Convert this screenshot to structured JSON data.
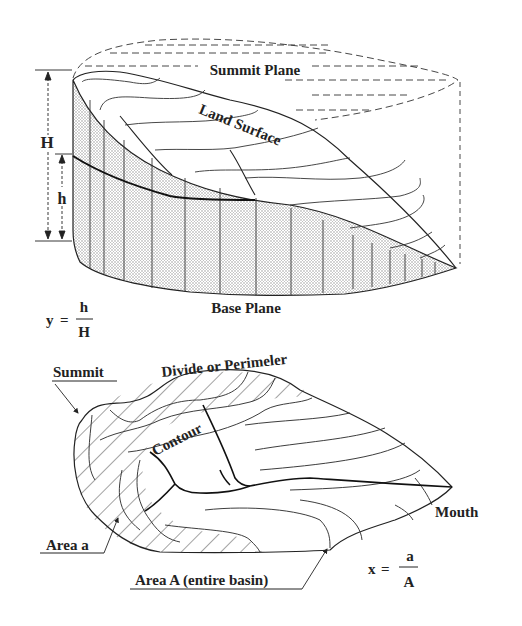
{
  "figure": {
    "top_panel": {
      "summit_plane_label": "Summit Plane",
      "land_surface_label": "Land Surface",
      "base_plane_label": "Base Plane",
      "total_height_label": "H",
      "partial_height_label": "h",
      "ratio_formula": {
        "lhs": "y",
        "eq": "=",
        "numerator": "h",
        "denominator": "H"
      }
    },
    "bottom_panel": {
      "summit_label": "Summit",
      "divide_label": "Divide or Perimeler",
      "contour_label": "Contour",
      "mouth_label": "Mouth",
      "area_a_label": "Area a",
      "area_A_label": "Area A (entire basin)",
      "ratio_formula": {
        "lhs": "x",
        "eq": "=",
        "numerator": "a",
        "denominator": "A"
      }
    },
    "colors": {
      "ink": "#222222",
      "fill_stipple": "#c8c8c8",
      "background": "#ffffff"
    }
  }
}
